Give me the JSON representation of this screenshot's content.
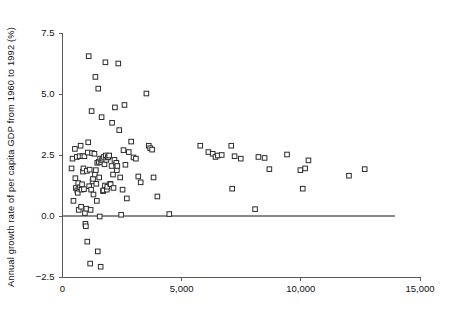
{
  "chart_data": {
    "type": "scatter",
    "title": "",
    "subtitle": "",
    "xlabel": "",
    "ylabel": "Annual growth rate of per capita GDP from 1960 to 1992 (%)",
    "xlim": [
      0,
      15000
    ],
    "ylim": [
      -2.5,
      7.5
    ],
    "grid": false,
    "legend": null,
    "x_ticks": [
      0,
      5000,
      10000,
      15000
    ],
    "x_tick_labels": [
      "0",
      "5,000",
      "10,000",
      "15,000"
    ],
    "y_ticks": [
      -2.5,
      0.0,
      2.5,
      5.0,
      7.5
    ],
    "y_tick_labels": [
      "-2.5",
      "0.0",
      "2.5",
      "5.0",
      "7.5"
    ],
    "marker": "open-square",
    "marker_color": "#2b2b2b",
    "reference_lines": [
      {
        "axis": "y",
        "value": 0.0,
        "color": "#8a8a8a"
      }
    ],
    "series": [
      {
        "name": "countries",
        "points": [
          [
            380,
            1.95
          ],
          [
            420,
            2.35
          ],
          [
            460,
            0.62
          ],
          [
            520,
            2.75
          ],
          [
            540,
            1.55
          ],
          [
            560,
            1.15
          ],
          [
            600,
            2.42
          ],
          [
            620,
            1.05
          ],
          [
            640,
            0.95
          ],
          [
            660,
            1.35
          ],
          [
            680,
            0.25
          ],
          [
            700,
            1.12
          ],
          [
            720,
            2.45
          ],
          [
            740,
            1.18
          ],
          [
            760,
            2.88
          ],
          [
            780,
            0.38
          ],
          [
            800,
            1.08
          ],
          [
            820,
            1.3
          ],
          [
            840,
            2.45
          ],
          [
            860,
            1.82
          ],
          [
            880,
            1.95
          ],
          [
            900,
            1.1
          ],
          [
            920,
            2.45
          ],
          [
            940,
            0.12
          ],
          [
            960,
            -0.32
          ],
          [
            980,
            -0.42
          ],
          [
            1000,
            0.3
          ],
          [
            1020,
            1.85
          ],
          [
            1040,
            -1.05
          ],
          [
            1060,
            2.6
          ],
          [
            1080,
            3.02
          ],
          [
            1100,
            6.55
          ],
          [
            1120,
            1.22
          ],
          [
            1140,
            1.9
          ],
          [
            1160,
            -1.95
          ],
          [
            1180,
            0.25
          ],
          [
            1200,
            1.08
          ],
          [
            1220,
            4.3
          ],
          [
            1240,
            2.58
          ],
          [
            1260,
            1.42
          ],
          [
            1280,
            1.52
          ],
          [
            1300,
            0.88
          ],
          [
            1340,
            2.55
          ],
          [
            1360,
            1.7
          ],
          [
            1380,
            5.7
          ],
          [
            1400,
            1.88
          ],
          [
            1420,
            1.32
          ],
          [
            1440,
            0.62
          ],
          [
            1460,
            2.18
          ],
          [
            1480,
            -1.45
          ],
          [
            1500,
            5.22
          ],
          [
            1520,
            2.22
          ],
          [
            1540,
            1.58
          ],
          [
            1560,
            -0.02
          ],
          [
            1580,
            2.35
          ],
          [
            1600,
            -2.08
          ],
          [
            1620,
            2.2
          ],
          [
            1640,
            4.05
          ],
          [
            1660,
            2.28
          ],
          [
            1680,
            2.35
          ],
          [
            1700,
            1.02
          ],
          [
            1720,
            1.05
          ],
          [
            1740,
            2.42
          ],
          [
            1760,
            2.12
          ],
          [
            1780,
            1.25
          ],
          [
            1800,
            6.3
          ],
          [
            1820,
            2.48
          ],
          [
            1840,
            2.3
          ],
          [
            1860,
            1.08
          ],
          [
            1880,
            1.2
          ],
          [
            1900,
            2.4
          ],
          [
            1920,
            2.42
          ],
          [
            1960,
            2.48
          ],
          [
            2000,
            1.32
          ],
          [
            2020,
            1.3
          ],
          [
            2060,
            2.05
          ],
          [
            2080,
            3.82
          ],
          [
            2120,
            1.7
          ],
          [
            2140,
            1.15
          ],
          [
            2180,
            2.3
          ],
          [
            2200,
            4.45
          ],
          [
            2260,
            2.18
          ],
          [
            2280,
            1.88
          ],
          [
            2300,
            2.05
          ],
          [
            2340,
            6.25
          ],
          [
            2380,
            3.52
          ],
          [
            2420,
            1.58
          ],
          [
            2460,
            0.05
          ],
          [
            2520,
            1.08
          ],
          [
            2560,
            2.7
          ],
          [
            2600,
            4.55
          ],
          [
            2640,
            2.1
          ],
          [
            2700,
            0.72
          ],
          [
            2780,
            2.62
          ],
          [
            2880,
            3.05
          ],
          [
            2980,
            2.4
          ],
          [
            3080,
            2.35
          ],
          [
            3180,
            1.62
          ],
          [
            3280,
            1.38
          ],
          [
            3520,
            5.02
          ],
          [
            3620,
            2.88
          ],
          [
            3680,
            2.78
          ],
          [
            3760,
            2.72
          ],
          [
            3820,
            1.58
          ],
          [
            3980,
            0.8
          ],
          [
            4480,
            0.08
          ],
          [
            5780,
            2.88
          ],
          [
            6120,
            2.62
          ],
          [
            6300,
            2.55
          ],
          [
            6420,
            2.42
          ],
          [
            6520,
            2.48
          ],
          [
            6680,
            2.5
          ],
          [
            7080,
            2.88
          ],
          [
            7120,
            1.12
          ],
          [
            7220,
            2.45
          ],
          [
            7480,
            2.35
          ],
          [
            8080,
            0.28
          ],
          [
            8220,
            2.42
          ],
          [
            8480,
            2.38
          ],
          [
            8680,
            1.92
          ],
          [
            9420,
            2.52
          ],
          [
            9980,
            1.88
          ],
          [
            10080,
            1.12
          ],
          [
            10180,
            1.95
          ],
          [
            10320,
            2.28
          ],
          [
            12020,
            1.65
          ],
          [
            12680,
            1.92
          ]
        ]
      }
    ]
  },
  "axes": {
    "y_label_text": "Annual growth rate of per capita GDP from 1960 to 1992 (%)"
  }
}
